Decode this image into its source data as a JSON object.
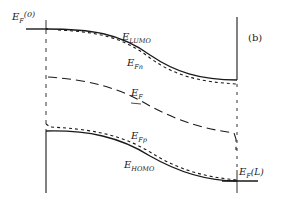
{
  "diagram": {
    "panel_label": "(b)",
    "labels": {
      "ef0": {
        "main": "E",
        "sub": "F",
        "suffix": "(0)"
      },
      "lumo": {
        "main": "E",
        "sub": "LUMO"
      },
      "efn": {
        "main": "E",
        "sub": "Fn"
      },
      "ef": {
        "main": "E",
        "sub": "F"
      },
      "efp": {
        "main": "E",
        "sub": "Fp"
      },
      "homo": {
        "main": "E",
        "sub": "HOMO"
      },
      "efl": {
        "main": "E",
        "sub": "F",
        "suffix": "(L)"
      }
    },
    "colors": {
      "ink": "#1a1a1a",
      "background": "#ffffff"
    }
  }
}
